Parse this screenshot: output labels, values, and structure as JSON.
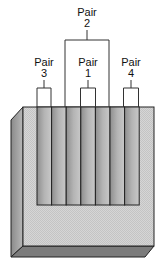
{
  "diagram": {
    "labels": [
      {
        "id": "pair2",
        "word": "Pair",
        "number": "2",
        "x": 96,
        "y": 6
      },
      {
        "id": "pair3",
        "word": "Pair",
        "number": "3",
        "x": 44,
        "y": 60
      },
      {
        "id": "pair1",
        "word": "Pair",
        "number": "1",
        "x": 88,
        "y": 60
      },
      {
        "id": "pair4",
        "word": "Pair",
        "number": "4",
        "x": 131,
        "y": 60
      }
    ],
    "pins": {
      "count": 8,
      "wires_pairing": [
        {
          "pair": "3",
          "pins": [
            1,
            2
          ]
        },
        {
          "pair": "2",
          "pins": [
            3,
            6
          ]
        },
        {
          "pair": "1",
          "pins": [
            4,
            5
          ]
        },
        {
          "pair": "4",
          "pins": [
            7,
            8
          ]
        }
      ]
    },
    "colors": {
      "outline": "#222222",
      "front_face": "#d4d4d4",
      "side_face": "#a8a8a8",
      "bottom_face": "#7c7c7c",
      "pin_dark": "#9a9a9a",
      "pin_light": "#bdbdbd"
    }
  }
}
